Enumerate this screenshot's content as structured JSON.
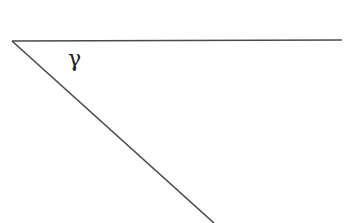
{
  "diagram": {
    "type": "angle",
    "angle_label": "γ",
    "stroke_color": "#4a4a4a",
    "background": "#ffffff",
    "vertex": {
      "x": 12,
      "y": 41
    },
    "rays": [
      {
        "name": "horizontal",
        "end": {
          "x": 342,
          "y": 40
        }
      },
      {
        "name": "diagonal",
        "end": {
          "x": 214,
          "y": 223
        }
      }
    ],
    "label_position": {
      "x": 68,
      "y": 48
    }
  }
}
